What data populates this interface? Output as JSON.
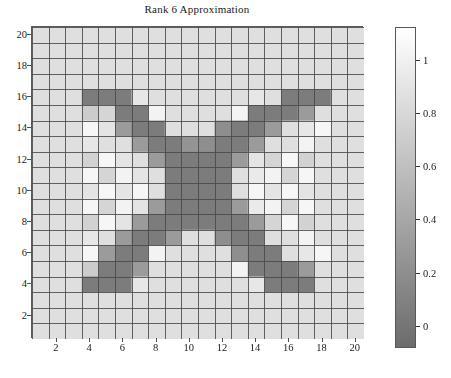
{
  "chart_data": {
    "type": "heatmap",
    "title": "Rank 6 Approximation",
    "xlabel": "",
    "ylabel": "",
    "grid": true,
    "colormap": "gray",
    "nrows": 20,
    "ncols": 20,
    "x": [
      1,
      2,
      3,
      4,
      5,
      6,
      7,
      8,
      9,
      10,
      11,
      12,
      13,
      14,
      15,
      16,
      17,
      18,
      19,
      20
    ],
    "y": [
      1,
      2,
      3,
      4,
      5,
      6,
      7,
      8,
      9,
      10,
      11,
      12,
      13,
      14,
      15,
      16,
      17,
      18,
      19,
      20
    ],
    "xticks": [
      2,
      4,
      6,
      8,
      10,
      12,
      14,
      16,
      18,
      20
    ],
    "xtick_labels": [
      "2",
      "4",
      "6",
      "8",
      "10",
      "12",
      "14",
      "16",
      "18",
      "20"
    ],
    "yticks": [
      2,
      4,
      6,
      8,
      10,
      12,
      14,
      16,
      18,
      20
    ],
    "ytick_labels": [
      "2",
      "4",
      "6",
      "8",
      "10",
      "12",
      "14",
      "16",
      "18",
      "20"
    ],
    "y_axis_direction": "descending",
    "xlim": [
      1,
      21
    ],
    "ylim": [
      21,
      1
    ],
    "clim": [
      -0.08,
      1.12
    ],
    "colorbar": {
      "ticks": [
        0,
        0.2,
        0.4,
        0.6,
        0.8,
        1
      ],
      "tick_labels": [
        "0",
        "0.2",
        "0.4",
        "0.6",
        "0.8",
        "1"
      ],
      "position": "right",
      "orientation": "vertical",
      "low_color": "#6e7173",
      "high_color": "#ffffff"
    },
    "values": [
      [
        0.86,
        0.86,
        0.86,
        0.86,
        0.86,
        0.86,
        0.86,
        0.86,
        0.86,
        0.86,
        0.86,
        0.86,
        0.86,
        0.86,
        0.86,
        0.86,
        0.86,
        0.86,
        0.86,
        0.86
      ],
      [
        0.86,
        0.86,
        0.86,
        0.86,
        0.86,
        0.86,
        0.86,
        0.86,
        0.86,
        0.86,
        0.86,
        0.86,
        0.86,
        0.86,
        0.86,
        0.86,
        0.86,
        0.86,
        0.86,
        0.86
      ],
      [
        0.86,
        0.86,
        0.86,
        0.86,
        0.86,
        0.86,
        0.86,
        0.86,
        0.86,
        0.86,
        0.86,
        0.86,
        0.86,
        0.86,
        0.86,
        0.86,
        0.86,
        0.86,
        0.86,
        0.86
      ],
      [
        0.86,
        0.86,
        0.86,
        0.86,
        0.86,
        0.86,
        0.86,
        0.86,
        0.86,
        0.86,
        0.86,
        0.86,
        0.86,
        0.86,
        0.86,
        0.86,
        0.86,
        0.86,
        0.86,
        0.86
      ],
      [
        0.86,
        0.86,
        0.86,
        0.05,
        0.05,
        0.05,
        0.92,
        0.86,
        0.86,
        0.86,
        0.86,
        0.86,
        0.86,
        0.92,
        0.86,
        0.05,
        0.05,
        0.05,
        0.86,
        0.86
      ],
      [
        0.86,
        0.86,
        0.86,
        0.7,
        0.78,
        0.05,
        0.05,
        1.02,
        0.86,
        0.86,
        0.86,
        0.86,
        1.02,
        0.05,
        0.05,
        0.05,
        0.3,
        0.86,
        0.86,
        0.86
      ],
      [
        0.86,
        0.86,
        0.86,
        1.05,
        0.9,
        0.3,
        0.05,
        0.05,
        0.86,
        0.86,
        0.86,
        0.2,
        0.05,
        0.05,
        0.3,
        0.86,
        0.92,
        1.05,
        0.86,
        0.86
      ],
      [
        0.86,
        0.86,
        0.86,
        0.92,
        0.86,
        0.86,
        0.3,
        0.05,
        0.05,
        0.25,
        0.2,
        0.05,
        0.05,
        0.3,
        0.86,
        0.86,
        1.02,
        0.86,
        0.86,
        0.86
      ],
      [
        0.86,
        0.86,
        0.86,
        0.75,
        1.05,
        0.9,
        0.86,
        0.3,
        0.05,
        0.05,
        0.05,
        0.05,
        0.3,
        0.9,
        0.78,
        1.05,
        0.75,
        0.86,
        0.86,
        0.86
      ],
      [
        0.86,
        0.86,
        0.86,
        1.05,
        0.78,
        1.02,
        0.9,
        0.86,
        0.05,
        0.05,
        0.05,
        0.05,
        0.86,
        0.95,
        1.02,
        0.78,
        1.05,
        0.86,
        0.86,
        0.86
      ],
      [
        0.86,
        0.86,
        0.86,
        0.9,
        1.05,
        0.9,
        1.05,
        0.86,
        0.05,
        0.05,
        0.05,
        0.05,
        0.86,
        1.05,
        0.9,
        1.05,
        0.9,
        0.86,
        0.86,
        0.86
      ],
      [
        0.86,
        0.86,
        0.86,
        1.05,
        0.78,
        1.02,
        0.9,
        0.3,
        0.05,
        0.05,
        0.05,
        0.05,
        0.3,
        0.95,
        1.02,
        0.78,
        1.05,
        0.86,
        0.86,
        0.86
      ],
      [
        0.86,
        0.86,
        0.86,
        0.75,
        1.05,
        0.9,
        0.3,
        0.05,
        0.05,
        0.05,
        0.05,
        0.05,
        0.05,
        0.3,
        0.78,
        1.05,
        0.75,
        0.86,
        0.86,
        0.86
      ],
      [
        0.86,
        0.86,
        0.86,
        0.92,
        0.86,
        0.3,
        0.05,
        0.05,
        0.3,
        0.86,
        0.86,
        0.2,
        0.05,
        0.05,
        0.86,
        0.86,
        1.02,
        0.86,
        0.86,
        0.86
      ],
      [
        0.86,
        0.86,
        0.86,
        1.05,
        0.3,
        0.05,
        0.05,
        1.02,
        0.86,
        0.86,
        0.86,
        0.86,
        0.2,
        0.05,
        0.05,
        0.86,
        0.92,
        1.05,
        0.86,
        0.86
      ],
      [
        0.86,
        0.86,
        0.86,
        0.7,
        0.05,
        0.05,
        0.3,
        0.86,
        0.86,
        0.86,
        0.86,
        0.86,
        1.02,
        0.05,
        0.05,
        0.05,
        0.3,
        0.86,
        0.86,
        0.86
      ],
      [
        0.86,
        0.86,
        0.86,
        0.05,
        0.05,
        0.05,
        0.92,
        0.86,
        0.86,
        0.86,
        0.86,
        0.86,
        0.86,
        0.92,
        0.05,
        0.05,
        0.05,
        0.86,
        0.86,
        0.86
      ],
      [
        0.86,
        0.86,
        0.86,
        0.86,
        0.86,
        0.86,
        0.86,
        0.86,
        0.86,
        0.86,
        0.86,
        0.86,
        0.86,
        0.86,
        0.86,
        0.86,
        0.86,
        0.86,
        0.86,
        0.86
      ],
      [
        0.86,
        0.86,
        0.86,
        0.86,
        0.86,
        0.86,
        0.86,
        0.86,
        0.86,
        0.86,
        0.86,
        0.86,
        0.86,
        0.86,
        0.86,
        0.86,
        0.86,
        0.86,
        0.86,
        0.86
      ],
      [
        0.86,
        0.86,
        0.86,
        0.86,
        0.86,
        0.86,
        0.86,
        0.86,
        0.86,
        0.86,
        0.86,
        0.86,
        0.86,
        0.86,
        0.86,
        0.86,
        0.86,
        0.86,
        0.86,
        0.86
      ]
    ]
  }
}
